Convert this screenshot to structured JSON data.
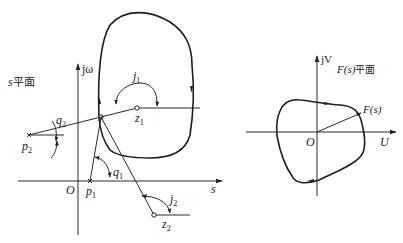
{
  "left_plane": {
    "plane_label_var": "s",
    "plane_label_cn": "平面",
    "imag_axis_label": "jω",
    "real_axis_label": "s",
    "origin_label": "O",
    "points": {
      "p1": {
        "label": "p",
        "sub": "1",
        "type": "pole"
      },
      "p2": {
        "label": "p",
        "sub": "2",
        "type": "pole"
      },
      "z1": {
        "label": "z",
        "sub": "1",
        "type": "zero"
      },
      "z2": {
        "label": "z",
        "sub": "2",
        "type": "zero"
      }
    },
    "angles": {
      "theta1": {
        "label": "q",
        "sub": "1"
      },
      "theta2": {
        "label": "q",
        "sub": "2"
      },
      "phi1": {
        "label": "j",
        "sub": "1"
      },
      "phi2": {
        "label": "j",
        "sub": "2"
      }
    }
  },
  "right_plane": {
    "plane_label": "F(s)平面",
    "plane_label_var": "F(s)",
    "plane_label_cn": "平面",
    "imag_axis_label": "jV",
    "real_axis_label": "U",
    "origin_label": "O",
    "vector_label": "F(s)"
  },
  "colors": {
    "ink": "#222222",
    "background": "#ffffff"
  }
}
